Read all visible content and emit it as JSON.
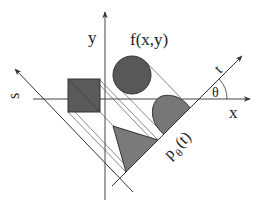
{
  "diagram": {
    "labels": {
      "y_axis": "y",
      "x_axis": "x",
      "s_axis": "s",
      "t_axis": "t",
      "function": "f(x,y)",
      "angle": "θ",
      "projection_p": "p",
      "projection_sub": "θ",
      "projection_arg": "(t)"
    },
    "colors": {
      "line": "#333333",
      "thin_line": "#555555",
      "circle_fill": "#585858",
      "square_fill": "#5a5a5a",
      "halfdisk_fill": "#777777",
      "triangle_fill": "#7a7a7a",
      "background": "#ffffff"
    },
    "shapes": [
      {
        "type": "circle",
        "name": "circle"
      },
      {
        "type": "square",
        "name": "square"
      },
      {
        "type": "half-disk",
        "name": "projected half-disk"
      },
      {
        "type": "triangle",
        "name": "projected triangle"
      }
    ]
  }
}
